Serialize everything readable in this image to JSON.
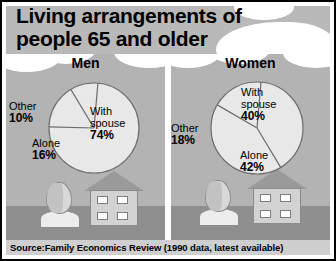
{
  "title": {
    "line1": "Living arrangements of",
    "line2": "people 65 and older"
  },
  "source": {
    "text": "Source:Family Economics Review (1990 data, latest available)"
  },
  "panels": [
    {
      "heading": "Men",
      "labels": {
        "spouse_name": "With",
        "spouse_name2": "spouse",
        "spouse_value": "74%",
        "other_name": "Other",
        "other_value": "10%",
        "alone_name": "Alone",
        "alone_value": "16%"
      }
    },
    {
      "heading": "Women",
      "labels": {
        "spouse_name": "With",
        "spouse_name2": "spouse",
        "spouse_value": "40%",
        "other_name": "Other",
        "other_value": "18%",
        "alone_name": "Alone",
        "alone_value": "42%"
      }
    }
  ],
  "colors": {
    "frame": "#000000",
    "header_band": "#b9b9b9",
    "panel_background": "#b3b3b3",
    "ground": "#8f8f8f",
    "pie_fill": "#e8e8e8",
    "pie_stroke": "#6d6d6d",
    "source_bar": "#cfcfcf",
    "text": "#000000"
  },
  "chart_data": [
    {
      "type": "pie",
      "title": "Men",
      "categories": [
        "With spouse",
        "Alone",
        "Other"
      ],
      "values": [
        74,
        16,
        10
      ],
      "units": "percent",
      "labels": [
        "74%",
        "16%",
        "10%"
      ],
      "legend": "none",
      "data_labels": true
    },
    {
      "type": "pie",
      "title": "Women",
      "categories": [
        "With spouse",
        "Alone",
        "Other"
      ],
      "values": [
        40,
        42,
        18
      ],
      "units": "percent",
      "labels": [
        "40%",
        "42%",
        "18%"
      ],
      "legend": "none",
      "data_labels": true
    }
  ],
  "illustration": {
    "items": [
      "head-profile-icon",
      "house-icon"
    ]
  }
}
